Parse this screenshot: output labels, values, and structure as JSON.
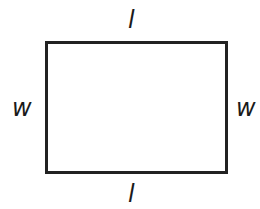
{
  "diagram": {
    "shape": "rectangle",
    "stroke_color": "#222222",
    "fill_color": "#ffffff",
    "labels": {
      "top": "l",
      "bottom": "l",
      "left": "w",
      "right": "w"
    }
  }
}
